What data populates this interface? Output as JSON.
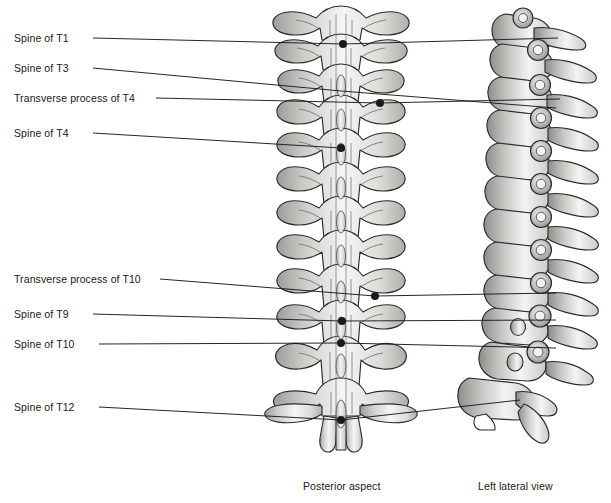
{
  "figure": {
    "background": "#ffffff",
    "ink": "#1a1a1a",
    "bone_fill": "#f4f3f1",
    "bone_outline": "#2b2b2b",
    "shade_mid": "#b9b7b4",
    "shade_dark": "#8d8b88"
  },
  "labels": [
    {
      "id": "spine-t1",
      "text": "Spine of T1",
      "x": 14,
      "y": 32,
      "anchor_x": 93,
      "anchor_y": 38,
      "target_x": 343,
      "target_y": 44,
      "dot": true,
      "extends_to_lateral": true,
      "lateral_x": 558,
      "lateral_y": 38
    },
    {
      "id": "spine-t3",
      "text": "Spine of T3",
      "x": 14,
      "y": 62,
      "anchor_x": 93,
      "anchor_y": 68,
      "target_x": 341,
      "target_y": 91,
      "dot": false,
      "extends_to_lateral": true,
      "lateral_x": 556,
      "lateral_y": 108
    },
    {
      "id": "tp-t4",
      "text": "Transverse process of T4",
      "x": 14,
      "y": 92,
      "anchor_x": 156,
      "anchor_y": 98,
      "target_x": 380,
      "target_y": 103,
      "dot": true,
      "extends_to_lateral": true,
      "lateral_x": 560,
      "lateral_y": 99
    },
    {
      "id": "spine-t4",
      "text": "Spine of T4",
      "x": 14,
      "y": 127,
      "anchor_x": 93,
      "anchor_y": 133,
      "target_x": 341,
      "target_y": 148,
      "dot": true,
      "extends_to_lateral": false,
      "lateral_x": 0,
      "lateral_y": 0
    },
    {
      "id": "tp-t10",
      "text": "Transverse process of T10",
      "x": 14,
      "y": 273,
      "anchor_x": 160,
      "anchor_y": 279,
      "target_x": 375,
      "target_y": 296,
      "dot": true,
      "extends_to_lateral": true,
      "lateral_x": 556,
      "lateral_y": 293
    },
    {
      "id": "spine-t9",
      "text": "Spine of T9",
      "x": 14,
      "y": 308,
      "anchor_x": 93,
      "anchor_y": 314,
      "target_x": 342,
      "target_y": 321,
      "dot": true,
      "extends_to_lateral": true,
      "lateral_x": 556,
      "lateral_y": 320
    },
    {
      "id": "spine-t10",
      "text": "Spine of T10",
      "x": 14,
      "y": 338,
      "anchor_x": 99,
      "anchor_y": 344,
      "target_x": 341,
      "target_y": 343,
      "dot": true,
      "extends_to_lateral": true,
      "lateral_x": 556,
      "lateral_y": 348
    },
    {
      "id": "spine-t12",
      "text": "Spine of T12",
      "x": 14,
      "y": 401,
      "anchor_x": 99,
      "anchor_y": 407,
      "target_x": 341,
      "target_y": 420,
      "dot": true,
      "extends_to_lateral": true,
      "lateral_x": 520,
      "lateral_y": 400
    }
  ],
  "captions": [
    {
      "id": "caption-posterior",
      "text": "Posterior aspect",
      "x": 303,
      "y": 480
    },
    {
      "id": "caption-lateral",
      "text": "Left lateral view",
      "x": 478,
      "y": 480
    }
  ],
  "views": {
    "posterior": {
      "name": "posterior-aspect-spine",
      "center_x": 341,
      "top_y": 2,
      "bottom_y": 455
    },
    "lateral": {
      "name": "left-lateral-view-spine",
      "center_x": 535,
      "top_y": 2,
      "bottom_y": 455
    }
  }
}
